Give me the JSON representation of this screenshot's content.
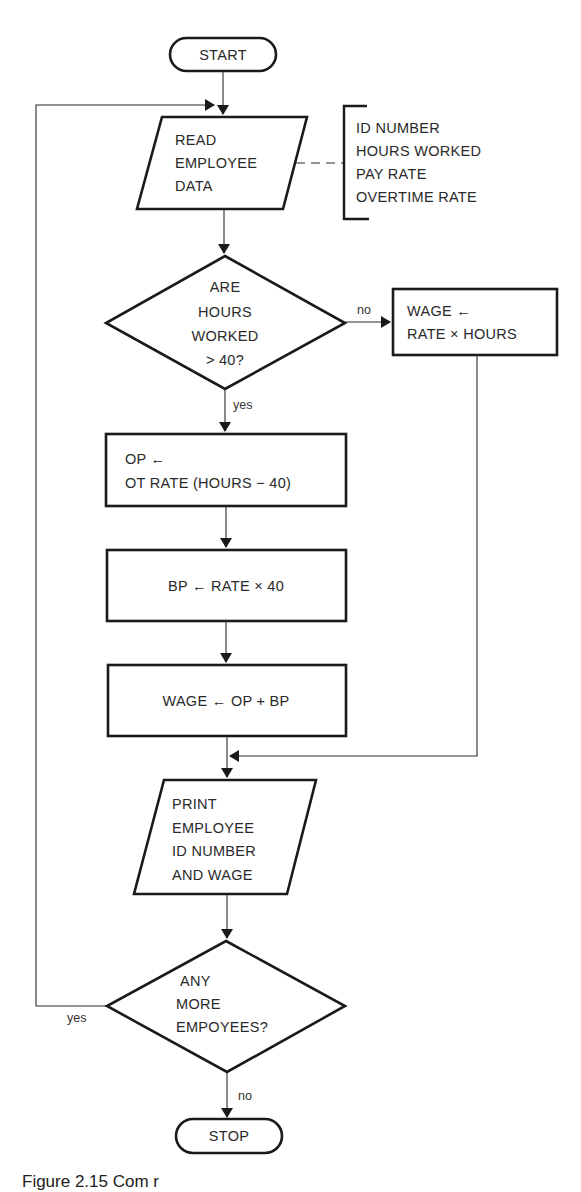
{
  "diagram": {
    "type": "flowchart",
    "nodes": {
      "start": {
        "shape": "terminal",
        "label": "START"
      },
      "read": {
        "shape": "input-output",
        "lines": [
          "READ",
          "EMPLOYEE",
          "DATA"
        ]
      },
      "annotation": {
        "shape": "bracket-comment",
        "lines": [
          "ID NUMBER",
          "HOURS WORKED",
          "PAY RATE",
          "OVERTIME RATE"
        ]
      },
      "decision_hours": {
        "shape": "decision",
        "lines": [
          "ARE",
          "HOURS",
          "WORKED",
          "> 40?"
        ]
      },
      "wage_simple": {
        "shape": "process",
        "lines": [
          "WAGE ←",
          "RATE × HOURS"
        ]
      },
      "op": {
        "shape": "process",
        "lines": [
          "OP ←",
          "OT RATE (HOURS − 40)"
        ]
      },
      "bp": {
        "shape": "process",
        "lines": [
          "BP ←  RATE × 40"
        ]
      },
      "wage_total": {
        "shape": "process",
        "lines": [
          "WAGE ← OP + BP"
        ]
      },
      "print": {
        "shape": "input-output",
        "lines": [
          "PRINT",
          "EMPLOYEE",
          "ID NUMBER",
          "AND WAGE"
        ]
      },
      "decision_more": {
        "shape": "decision",
        "lines": [
          "ANY",
          "MORE",
          "EMPOYEES?"
        ]
      },
      "stop": {
        "shape": "terminal",
        "label": "STOP"
      }
    },
    "edge_labels": {
      "hours_no": "no",
      "hours_yes": "yes",
      "more_yes": "yes",
      "more_no": "no"
    },
    "edges": [
      {
        "from": "start",
        "to": "read"
      },
      {
        "from": "read",
        "to": "annotation",
        "style": "dashed"
      },
      {
        "from": "read",
        "to": "decision_hours"
      },
      {
        "from": "decision_hours",
        "to": "wage_simple",
        "label": "no"
      },
      {
        "from": "decision_hours",
        "to": "op",
        "label": "yes"
      },
      {
        "from": "op",
        "to": "bp"
      },
      {
        "from": "bp",
        "to": "wage_total"
      },
      {
        "from": "wage_total",
        "to": "print"
      },
      {
        "from": "wage_simple",
        "to": "print"
      },
      {
        "from": "print",
        "to": "decision_more"
      },
      {
        "from": "decision_more",
        "to": "read",
        "label": "yes"
      },
      {
        "from": "decision_more",
        "to": "stop",
        "label": "no"
      }
    ]
  },
  "caption": "Figure 2.15  Com          r"
}
